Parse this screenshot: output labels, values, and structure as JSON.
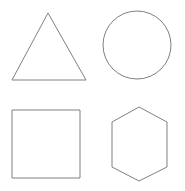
{
  "canvas": {
    "width": 185,
    "height": 191,
    "background_color": "#ffffff",
    "description": "Four unfilled geometric shape outlines arranged in a 2x2 grid"
  },
  "style": {
    "stroke_color": "#808080",
    "fill_color": "#ffffff",
    "stroke_width": 1
  },
  "shapes": [
    {
      "id": "triangle",
      "name": "triangle",
      "label": "Triangle",
      "grid_position": "top-left",
      "sides": 3,
      "points": "48,13 86,80 12,80",
      "bounds": {
        "x": 12,
        "y": 13,
        "width": 74,
        "height": 67
      }
    },
    {
      "id": "circle",
      "name": "circle",
      "label": "Circle",
      "grid_position": "top-right",
      "sides": 0,
      "center": {
        "cx": 137,
        "cy": 45
      },
      "radius": 34,
      "bounds": {
        "x": 103,
        "y": 11,
        "width": 68,
        "height": 68
      }
    },
    {
      "id": "square",
      "name": "square",
      "label": "Square",
      "grid_position": "bottom-left",
      "sides": 4,
      "rect": {
        "x": 12,
        "y": 110,
        "width": 68,
        "height": 68
      },
      "bounds": {
        "x": 12,
        "y": 110,
        "width": 68,
        "height": 68
      }
    },
    {
      "id": "hexagon",
      "name": "hexagon",
      "label": "Hexagon",
      "grid_position": "bottom-right",
      "sides": 6,
      "orientation": "pointy-top",
      "points": "139,107 167,122 167,167 139,181 112,167 112,122",
      "bounds": {
        "x": 112,
        "y": 107,
        "width": 55,
        "height": 74
      }
    }
  ]
}
